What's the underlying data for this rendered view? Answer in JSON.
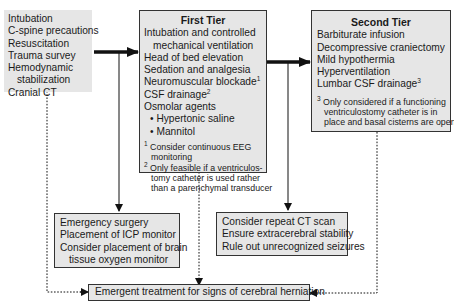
{
  "initial": {
    "lines": [
      "Intubation",
      "C-spine precautions",
      "Resuscitation",
      "Trauma survey",
      "Hemodynamic",
      "stabilization",
      "Cranial CT"
    ]
  },
  "first_tier": {
    "title": "First Tier",
    "items": [
      "Intubation and controlled",
      "mechanical ventilation",
      "Head of bed elevation",
      "Sedation and analgesia",
      "Neuromuscular blockade",
      "CSF drainage",
      "Osmolar agents"
    ],
    "sup": {
      "neuromuscular": "1",
      "csf": "2"
    },
    "bullets": [
      "Hypertonic saline",
      "Mannitol"
    ],
    "notes": [
      {
        "mark": "1",
        "lines": [
          "Consider continuous EEG",
          "monitoring"
        ]
      },
      {
        "mark": "2",
        "lines": [
          "Only feasible if a ventriculos-",
          "tomy catheter is used rather",
          "than a parenchymal transducer"
        ]
      }
    ]
  },
  "second_tier": {
    "title": "Second Tier",
    "items": [
      "Barbiturate infusion",
      "Decompressive craniectomy",
      "Mild hypothermia",
      "Hyperventilation",
      "Lumbar CSF drainage"
    ],
    "sup": {
      "lumbar": "3"
    },
    "notes": [
      {
        "mark": "3",
        "lines": [
          "Only considered if a functioning",
          "ventriculostomy catheter is in",
          "place and basal cisterns are open"
        ]
      }
    ]
  },
  "surgery_box": {
    "lines": [
      "Emergency surgery",
      "Placement of ICP monitor",
      "Consider placement of brain",
      "tissue oxygen monitor"
    ]
  },
  "ct_box": {
    "lines": [
      "Consider repeat CT scan",
      "Ensure extracerebral stability",
      "Rule out unrecognized seizures"
    ]
  },
  "herniation_box": {
    "label": "Emergent treatment for signs of cerebral herniation"
  },
  "colors": {
    "box_fill": "#e6e6e6",
    "border": "#333333",
    "line": "#111111"
  }
}
